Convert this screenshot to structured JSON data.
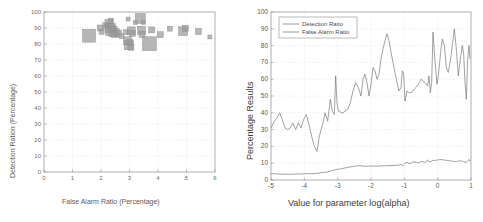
{
  "figure": {
    "background": "#ffffff",
    "axis_color": "#8c8c8c",
    "grid_color": "#d9d9d9",
    "marker_color": "#9a9a9a",
    "line_color": "#6f6f6f"
  },
  "left_panel": {
    "name": "scatter-panel"
  },
  "right_panel": {
    "name": "line-panel"
  },
  "chart_data": [
    {
      "type": "scatter",
      "title": "",
      "xlabel": "False Alarm Ratio (Percentage)",
      "ylabel": "Detection Ration (Percentage)",
      "xlim": [
        0,
        6
      ],
      "ylim": [
        0,
        100
      ],
      "xticks": [
        0,
        1,
        2,
        3,
        4,
        5,
        6
      ],
      "yticks": [
        0,
        10,
        20,
        30,
        40,
        50,
        60,
        70,
        80,
        90,
        100
      ],
      "xtick_labels": [
        "0",
        "1",
        "2",
        "3",
        "4",
        "5",
        "6"
      ],
      "ytick_labels": [
        "0",
        "10",
        "20",
        "30",
        "40",
        "50",
        "60",
        "70",
        "80",
        "90",
        "100"
      ],
      "grid": true,
      "legend": null,
      "marker": "square",
      "marker_color": "#9a9a9a",
      "points": [
        {
          "x": 1.58,
          "y": 85.2,
          "size": 13
        },
        {
          "x": 1.97,
          "y": 90.0,
          "size": 6
        },
        {
          "x": 2.02,
          "y": 87.6,
          "size": 5
        },
        {
          "x": 2.17,
          "y": 91.5,
          "size": 6
        },
        {
          "x": 2.28,
          "y": 92.8,
          "size": 8
        },
        {
          "x": 2.3,
          "y": 89.8,
          "size": 9
        },
        {
          "x": 2.33,
          "y": 88.4,
          "size": 10
        },
        {
          "x": 2.38,
          "y": 90.6,
          "size": 7
        },
        {
          "x": 2.42,
          "y": 87.0,
          "size": 8
        },
        {
          "x": 2.46,
          "y": 89.2,
          "size": 6
        },
        {
          "x": 2.5,
          "y": 86.2,
          "size": 7
        },
        {
          "x": 2.55,
          "y": 88.0,
          "size": 5
        },
        {
          "x": 2.62,
          "y": 86.8,
          "size": 6
        },
        {
          "x": 2.35,
          "y": 94.6,
          "size": 5
        },
        {
          "x": 2.72,
          "y": 85.0,
          "size": 5
        },
        {
          "x": 2.93,
          "y": 82.0,
          "size": 8
        },
        {
          "x": 2.97,
          "y": 79.2,
          "size": 9
        },
        {
          "x": 3.02,
          "y": 81.0,
          "size": 6
        },
        {
          "x": 3.05,
          "y": 78.0,
          "size": 6
        },
        {
          "x": 2.88,
          "y": 87.4,
          "size": 5
        },
        {
          "x": 3.06,
          "y": 88.2,
          "size": 8
        },
        {
          "x": 3.1,
          "y": 86.6,
          "size": 6
        },
        {
          "x": 2.95,
          "y": 95.6,
          "size": 4
        },
        {
          "x": 3.2,
          "y": 93.4,
          "size": 4
        },
        {
          "x": 3.38,
          "y": 96.0,
          "size": 10
        },
        {
          "x": 3.48,
          "y": 93.4,
          "size": 4
        },
        {
          "x": 3.42,
          "y": 88.6,
          "size": 8
        },
        {
          "x": 3.44,
          "y": 86.0,
          "size": 6
        },
        {
          "x": 3.7,
          "y": 80.2,
          "size": 14
        },
        {
          "x": 3.78,
          "y": 88.8,
          "size": 6
        },
        {
          "x": 4.08,
          "y": 85.8,
          "size": 6
        },
        {
          "x": 4.42,
          "y": 89.6,
          "size": 5
        },
        {
          "x": 4.88,
          "y": 88.0,
          "size": 9
        },
        {
          "x": 4.96,
          "y": 89.8,
          "size": 6
        },
        {
          "x": 5.42,
          "y": 87.8,
          "size": 6
        },
        {
          "x": 5.82,
          "y": 84.4,
          "size": 4
        }
      ]
    },
    {
      "type": "line",
      "title": "",
      "xlabel": "Value for parameter log(alpha)",
      "ylabel": "Percentage Results",
      "xlim": [
        -5,
        1
      ],
      "ylim": [
        0,
        100
      ],
      "xticks": [
        -5,
        -4,
        -3,
        -2,
        -1,
        0,
        1
      ],
      "yticks": [
        0,
        10,
        20,
        30,
        40,
        50,
        60,
        70,
        80,
        90,
        100
      ],
      "xtick_labels": [
        "-5",
        "-4",
        "-3",
        "-2",
        "-1",
        "0",
        "1"
      ],
      "ytick_labels": [
        "0",
        "10",
        "20",
        "30",
        "40",
        "50",
        "60",
        "70",
        "80",
        "90",
        "100"
      ],
      "grid": true,
      "legend_position": "top-left",
      "legend": [
        "Detection Ratio",
        "False Alarm Ratio"
      ],
      "series": [
        {
          "name": "Detection Ratio",
          "color": "#6f6f6f",
          "x": [
            -5.0,
            -4.9,
            -4.82,
            -4.74,
            -4.66,
            -4.58,
            -4.5,
            -4.42,
            -4.34,
            -4.26,
            -4.18,
            -4.1,
            -4.02,
            -3.94,
            -3.86,
            -3.78,
            -3.7,
            -3.62,
            -3.56,
            -3.5,
            -3.44,
            -3.38,
            -3.3,
            -3.22,
            -3.16,
            -3.1,
            -3.06,
            -3.02,
            -2.98,
            -2.94,
            -2.9,
            -2.84,
            -2.78,
            -2.7,
            -2.62,
            -2.54,
            -2.46,
            -2.38,
            -2.3,
            -2.24,
            -2.18,
            -2.12,
            -2.06,
            -2.0,
            -1.94,
            -1.88,
            -1.82,
            -1.76,
            -1.7,
            -1.64,
            -1.58,
            -1.52,
            -1.46,
            -1.4,
            -1.34,
            -1.28,
            -1.22,
            -1.16,
            -1.1,
            -1.06,
            -1.02,
            -0.98,
            -0.92,
            -0.86,
            -0.8,
            -0.74,
            -0.66,
            -0.58,
            -0.5,
            -0.44,
            -0.38,
            -0.34,
            -0.3,
            -0.26,
            -0.22,
            -0.18,
            -0.14,
            -0.1,
            -0.06,
            -0.02,
            0.02,
            0.06,
            0.1,
            0.14,
            0.2,
            0.26,
            0.32,
            0.38,
            0.44,
            0.5,
            0.56,
            0.62,
            0.68,
            0.74,
            0.78,
            0.82,
            0.86,
            0.9,
            0.94,
            0.97,
            1.0
          ],
          "y": [
            31,
            35,
            37,
            40,
            36,
            31,
            30,
            31,
            34,
            30,
            34,
            31,
            36,
            39,
            33,
            26,
            20,
            17,
            25,
            30,
            34,
            40,
            35,
            48,
            41,
            39,
            62,
            46,
            41,
            41,
            40,
            40,
            41,
            42,
            46,
            53,
            58,
            55,
            50,
            60,
            63,
            58,
            50,
            57,
            67,
            65,
            60,
            63,
            72,
            78,
            83,
            87,
            83,
            76,
            70,
            64,
            58,
            53,
            55,
            65,
            63,
            47,
            53,
            52,
            52,
            53,
            55,
            57,
            60,
            59,
            58,
            57,
            56,
            62,
            52,
            58,
            88,
            76,
            66,
            57,
            62,
            70,
            78,
            84,
            80,
            67,
            64,
            71,
            80,
            90,
            78,
            62,
            72,
            80,
            75,
            58,
            48,
            72,
            80,
            72
          ]
        },
        {
          "name": "False Alarm Ratio",
          "color": "#6f6f6f",
          "x": [
            -5.0,
            -4.9,
            -4.82,
            -4.74,
            -4.66,
            -4.58,
            -4.5,
            -4.42,
            -4.34,
            -4.26,
            -4.18,
            -4.1,
            -4.02,
            -3.94,
            -3.86,
            -3.78,
            -3.7,
            -3.62,
            -3.56,
            -3.5,
            -3.44,
            -3.38,
            -3.3,
            -3.22,
            -3.16,
            -3.1,
            -3.06,
            -3.02,
            -2.98,
            -2.94,
            -2.9,
            -2.84,
            -2.78,
            -2.7,
            -2.62,
            -2.54,
            -2.46,
            -2.38,
            -2.3,
            -2.24,
            -2.18,
            -2.12,
            -2.06,
            -2.0,
            -1.94,
            -1.88,
            -1.82,
            -1.76,
            -1.7,
            -1.64,
            -1.58,
            -1.52,
            -1.46,
            -1.4,
            -1.34,
            -1.28,
            -1.22,
            -1.16,
            -1.1,
            -1.06,
            -1.02,
            -0.98,
            -0.92,
            -0.86,
            -0.8,
            -0.74,
            -0.66,
            -0.58,
            -0.5,
            -0.44,
            -0.38,
            -0.34,
            -0.3,
            -0.26,
            -0.22,
            -0.18,
            -0.14,
            -0.1,
            -0.06,
            -0.02,
            0.02,
            0.06,
            0.1,
            0.14,
            0.2,
            0.26,
            0.32,
            0.38,
            0.44,
            0.5,
            0.56,
            0.62,
            0.68,
            0.74,
            0.78,
            0.82,
            0.86,
            0.9,
            0.94,
            0.97,
            1.0
          ],
          "y": [
            3.8,
            3.7,
            3.6,
            3.5,
            3.4,
            3.4,
            3.5,
            3.4,
            3.5,
            3.6,
            3.6,
            3.5,
            3.8,
            3.8,
            3.7,
            3.8,
            3.9,
            4.0,
            4.1,
            4.3,
            4.5,
            4.6,
            4.8,
            5.2,
            5.6,
            5.9,
            6.1,
            6.3,
            6.4,
            6.5,
            6.7,
            6.9,
            7.2,
            7.5,
            7.8,
            8.0,
            8.3,
            8.5,
            8.4,
            8.3,
            8.2,
            8.2,
            8.3,
            8.3,
            8.3,
            8.3,
            8.3,
            8.3,
            8.4,
            8.5,
            8.5,
            8.5,
            8.6,
            8.6,
            8.6,
            8.7,
            8.7,
            8.8,
            9.5,
            8.4,
            9.0,
            10.0,
            10.5,
            9.8,
            10.0,
            10.8,
            10.6,
            10.2,
            11.0,
            10.8,
            10.5,
            11.0,
            12.0,
            10.8,
            11.0,
            11.2,
            11.8,
            11.5,
            11.7,
            11.9,
            12.0,
            12.1,
            12.2,
            12.0,
            11.9,
            11.7,
            11.6,
            11.4,
            11.2,
            11.0,
            11.0,
            11.3,
            11.5,
            11.2,
            10.8,
            10.5,
            10.6,
            11.5,
            12.2,
            11.0
          ]
        }
      ]
    }
  ]
}
